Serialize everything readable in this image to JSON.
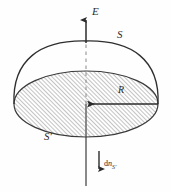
{
  "figure": {
    "background_color": "#fefefe",
    "ink_color": "#2b2b2b",
    "hatch_color": "#7a7a7a",
    "labels": {
      "field_vector": "E",
      "upper_surface": "S",
      "lower_surface": "S′",
      "radius": "R",
      "normal_element_prefix": "d",
      "normal_element_symbol": "n",
      "normal_element_subscript": "S′"
    },
    "top_artifact_text": "— – ———"
  },
  "geometry": {
    "center_x": 86,
    "disk_center_y": 104,
    "disk_radius_x": 72,
    "disk_radius_y": 33,
    "dome_apex_y": 42,
    "axis_top_y": 16,
    "axis_bottom_y": 186,
    "radius_arrow_from_x": 158,
    "radius_arrow_to_x": 88,
    "normal_arrow_x": 99,
    "normal_arrow_top_y": 152,
    "normal_arrow_bottom_y": 174
  }
}
